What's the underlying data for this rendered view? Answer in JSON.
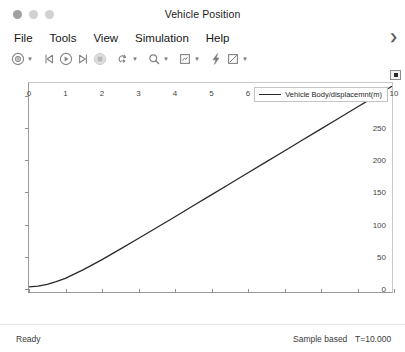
{
  "window": {
    "title": "Vehicle Position",
    "controls": [
      {
        "name": "close",
        "color": "#a0a0a0"
      },
      {
        "name": "minimize",
        "color": "#d2d2d2"
      },
      {
        "name": "maximize",
        "color": "#d2d2d2"
      }
    ]
  },
  "menubar": {
    "items": [
      "File",
      "Tools",
      "View",
      "Simulation",
      "Help"
    ],
    "overflow_glyph": "❯"
  },
  "toolbar": {
    "buttons": [
      {
        "icon": "config-target-icon",
        "label": "Configuration",
        "has_caret": true
      },
      {
        "icon": "rewind-icon",
        "label": "Rewind",
        "has_caret": false
      },
      {
        "icon": "run-icon",
        "label": "Run",
        "has_caret": false
      },
      {
        "icon": "step-forward-icon",
        "label": "Step Forward",
        "has_caret": false
      },
      {
        "icon": "stop-icon",
        "label": "Stop",
        "has_caret": false
      },
      {
        "icon": "pan-icon",
        "label": "Pan",
        "has_caret": true
      },
      {
        "icon": "zoom-icon",
        "label": "Zoom",
        "has_caret": true
      },
      {
        "icon": "fit-to-view-icon",
        "label": "Fit to View",
        "has_caret": true
      },
      {
        "icon": "trigger-icon",
        "label": "Trigger",
        "has_caret": false
      },
      {
        "icon": "measurements-icon",
        "label": "Measurements",
        "has_caret": true
      }
    ]
  },
  "plot": {
    "toolbar_button": "maximize-axes-icon",
    "legend": {
      "entries": [
        {
          "label": "Vehicle Body/displacemnt(m)",
          "color": "#2a2a2a"
        }
      ]
    }
  },
  "statusbar": {
    "state": "Ready",
    "mode": "Sample based",
    "time": "T=10.000"
  },
  "chart_data": {
    "type": "line",
    "title": "Vehicle Position",
    "xlabel": "",
    "ylabel": "",
    "xlim": [
      0,
      10
    ],
    "ylim": [
      -8,
      320
    ],
    "xticks": [
      0,
      1,
      2,
      3,
      4,
      5,
      6,
      7,
      8,
      9,
      10
    ],
    "yticks": [
      0,
      50,
      100,
      150,
      200,
      250,
      300
    ],
    "grid": true,
    "legend_position": "top-right",
    "series": [
      {
        "name": "Vehicle Body/displacemnt(m)",
        "color": "#2a2a2a",
        "x": [
          0,
          0.25,
          0.5,
          0.75,
          1,
          1.5,
          2,
          2.5,
          3,
          3.5,
          4,
          4.5,
          5,
          5.5,
          6,
          6.5,
          7,
          7.5,
          8,
          8.5,
          9,
          9.5,
          10
        ],
        "y": [
          0,
          1.2,
          4.0,
          8.2,
          13.5,
          27.0,
          42.5,
          58.8,
          75.5,
          92.4,
          109.4,
          126.5,
          143.6,
          160.7,
          177.9,
          195.0,
          212.2,
          229.3,
          246.5,
          263.6,
          280.8,
          297.9,
          315.0
        ]
      }
    ]
  }
}
